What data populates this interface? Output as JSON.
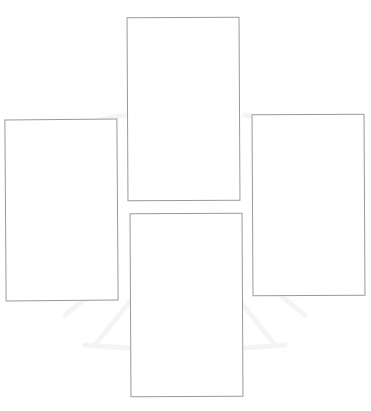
{
  "diagram": {
    "layout": "cross",
    "cards": [
      {
        "position": "top",
        "label": ""
      },
      {
        "position": "left",
        "label": ""
      },
      {
        "position": "right",
        "label": ""
      },
      {
        "position": "bottom",
        "label": ""
      }
    ],
    "watermark": {
      "visible": true,
      "shape": "emblem"
    }
  },
  "colors": {
    "background": "#ffffff",
    "card_border": "#9a9a9a",
    "watermark": "#d0d0d0"
  }
}
